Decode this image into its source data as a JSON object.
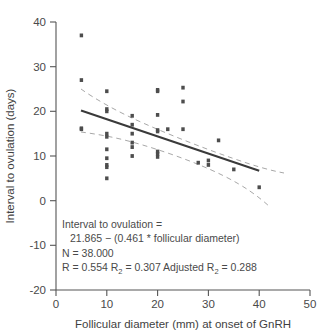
{
  "chart_data": {
    "type": "scatter",
    "title": "",
    "xlabel": "Follicular diameter (mm) at onset of GnRH",
    "ylabel": "Interval to ovulation (days)",
    "xlim": [
      0,
      50
    ],
    "ylim": [
      -20,
      40
    ],
    "xticks": [
      "0",
      "10",
      "20",
      "30",
      "40",
      "50"
    ],
    "xtick_values": [
      0,
      10,
      20,
      30,
      40,
      50
    ],
    "yticks": [
      "40",
      "30",
      "20",
      "10",
      "0",
      "-10",
      "-20"
    ],
    "ytick_values": [
      40,
      30,
      20,
      10,
      0,
      -10,
      -20
    ],
    "grid": false,
    "legend": "none",
    "marker_color": "#4d4d4d",
    "fit_line_color": "#3a3a3a",
    "ci_line_color": "#9a9a9a",
    "series": [
      {
        "name": "Observations",
        "n": 38,
        "points": [
          [
            5,
            37.0
          ],
          [
            5,
            27.0
          ],
          [
            5,
            16.0
          ],
          [
            5,
            16.2
          ],
          [
            10,
            24.5
          ],
          [
            10,
            20.5
          ],
          [
            10,
            20.0
          ],
          [
            10,
            15.0
          ],
          [
            10,
            14.3
          ],
          [
            10,
            11.5
          ],
          [
            10,
            9.5
          ],
          [
            10,
            8.0
          ],
          [
            10,
            7.5
          ],
          [
            10,
            5.0
          ],
          [
            15,
            19.0
          ],
          [
            15,
            17.0
          ],
          [
            15,
            15.0
          ],
          [
            15,
            13.0
          ],
          [
            15,
            12.0
          ],
          [
            15,
            10.0
          ],
          [
            20,
            24.8
          ],
          [
            20,
            24.5
          ],
          [
            20,
            19.2
          ],
          [
            20,
            15.8
          ],
          [
            20,
            15.5
          ],
          [
            20,
            11.0
          ],
          [
            20,
            10.5
          ],
          [
            20,
            9.8
          ],
          [
            22,
            16.0
          ],
          [
            25,
            25.3
          ],
          [
            25,
            22.2
          ],
          [
            25,
            16.0
          ],
          [
            28,
            8.5
          ],
          [
            30,
            9.0
          ],
          [
            30,
            8.0
          ],
          [
            32,
            13.5
          ],
          [
            35,
            7.0
          ],
          [
            40,
            3.0
          ]
        ]
      }
    ],
    "fit_line": {
      "equation": "y = 21.865 - 0.461 * x",
      "intercept": 21.865,
      "slope": -0.461,
      "x_start": 5,
      "x_end": 40
    },
    "confidence_bands": {
      "upper": [
        [
          5,
          24.6
        ],
        [
          10,
          20.0
        ],
        [
          15,
          17.6
        ],
        [
          20,
          15.3
        ],
        [
          25,
          13.0
        ],
        [
          30,
          10.8
        ],
        [
          35,
          9.0
        ],
        [
          40,
          7.2
        ]
      ],
      "lower": [
        [
          5,
          15.0
        ],
        [
          10,
          14.2
        ],
        [
          15,
          13.2
        ],
        [
          20,
          11.6
        ],
        [
          25,
          9.4
        ],
        [
          30,
          6.6
        ],
        [
          35,
          3.0
        ],
        [
          40,
          -0.8
        ]
      ]
    },
    "annotation": {
      "line1": "Interval to ovulation =",
      "line2": "21.865 − (0.461 * follicular diameter)",
      "line3": "N = 38.000",
      "line4_a": "R = 0.554 R",
      "line4_sub1": "2",
      "line4_b": " = 0.307 Adjusted R",
      "line4_sub2": "2",
      "line4_c": " = 0.288"
    }
  }
}
